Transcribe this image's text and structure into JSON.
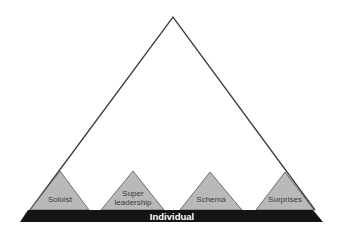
{
  "diagram": {
    "title": "",
    "base_label": "Individual",
    "sub_pyramids": [
      {
        "lines": [
          "Soloist"
        ]
      },
      {
        "lines": [
          "Super",
          "leadership"
        ]
      },
      {
        "lines": [
          "Schema"
        ]
      },
      {
        "lines": [
          "Surprises"
        ]
      }
    ],
    "colors": {
      "outline": "#3a3a3a",
      "sub_fill": "#b9b9b9",
      "bar_fill": "#141414",
      "bar_text": "#ffffff"
    }
  }
}
